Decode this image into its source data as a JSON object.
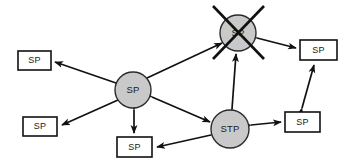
{
  "diagram": {
    "background_color": "#ffffff",
    "box_fill": "#ffffff",
    "box_stroke": "#111111",
    "circle_fill": "#c9c9c9",
    "circle_stroke": "#2b2b2b",
    "line_color": "#111111",
    "nodes": [
      {
        "id": "sp-box-top-left",
        "shape": "rect",
        "label": "SP",
        "x": 18,
        "y": 51,
        "w": 33,
        "h": 19,
        "state": "normal"
      },
      {
        "id": "sp-box-lower-left",
        "shape": "rect",
        "label": "SP",
        "x": 23,
        "y": 117,
        "w": 34,
        "h": 19,
        "state": "normal"
      },
      {
        "id": "sp-box-bottom-mid",
        "shape": "rect",
        "label": "SP",
        "x": 117,
        "y": 137,
        "w": 35,
        "h": 20,
        "state": "normal"
      },
      {
        "id": "sp-box-right-top",
        "shape": "rect",
        "label": "SP",
        "x": 300,
        "y": 40,
        "w": 37,
        "h": 20,
        "state": "normal"
      },
      {
        "id": "sp-box-right-bottom",
        "shape": "rect",
        "label": "SP",
        "x": 285,
        "y": 112,
        "w": 35,
        "h": 20,
        "state": "normal"
      },
      {
        "id": "sp-circle-center",
        "shape": "circle",
        "label": "SP",
        "cx": 133,
        "cy": 90,
        "r": 18,
        "state": "normal"
      },
      {
        "id": "sp-circle-failed",
        "shape": "circle",
        "label": "SP",
        "cx": 238,
        "cy": 33,
        "r": 18,
        "state": "crossed-out"
      },
      {
        "id": "stp-circle-bottom",
        "shape": "circle",
        "label": "STP",
        "cx": 230,
        "cy": 129,
        "r": 19,
        "state": "normal"
      }
    ],
    "links": [
      {
        "id": "link-center-to-topleft",
        "from": "sp-circle-center",
        "to": "sp-box-top-left",
        "arrows": "both"
      },
      {
        "id": "link-center-to-lowerleft",
        "from": "sp-circle-center",
        "to": "sp-box-lower-left",
        "arrows": "both"
      },
      {
        "id": "link-center-to-bottommid",
        "from": "sp-circle-center",
        "to": "sp-box-bottom-mid",
        "arrows": "both"
      },
      {
        "id": "link-center-to-failed",
        "from": "sp-circle-center",
        "to": "sp-circle-failed",
        "arrows": "both"
      },
      {
        "id": "link-center-to-stp",
        "from": "sp-circle-center",
        "to": "stp-circle-bottom",
        "arrows": "both"
      },
      {
        "id": "link-stp-to-failed",
        "from": "stp-circle-bottom",
        "to": "sp-circle-failed",
        "arrows": "both"
      },
      {
        "id": "link-stp-to-bottommid",
        "from": "stp-circle-bottom",
        "to": "sp-box-bottom-mid",
        "arrows": "both"
      },
      {
        "id": "link-stp-to-rightbottom",
        "from": "stp-circle-bottom",
        "to": "sp-box-right-bottom",
        "arrows": "both"
      },
      {
        "id": "link-failed-to-righttop",
        "from": "sp-circle-failed",
        "to": "sp-box-right-top",
        "arrows": "both"
      },
      {
        "id": "link-rightbottom-to-righttop",
        "from": "sp-box-right-bottom",
        "to": "sp-box-right-top",
        "arrows": "both"
      }
    ],
    "cross_marks": [
      {
        "id": "failure-cross",
        "on": "sp-circle-failed",
        "x1": 213,
        "y1": 6,
        "x2": 264,
        "y2": 59
      },
      {
        "id": "failure-cross-2",
        "on": "sp-circle-failed",
        "x1": 264,
        "y1": 6,
        "x2": 213,
        "y2": 59
      }
    ]
  }
}
